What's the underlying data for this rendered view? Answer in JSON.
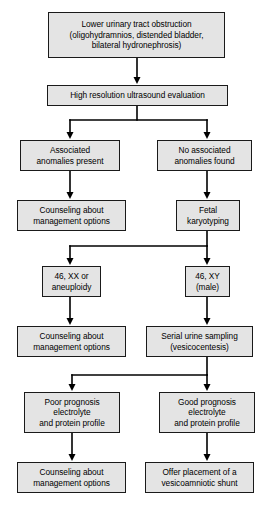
{
  "diagram": {
    "box_fill_color": "#e4e4e4",
    "box_border_color": "#1a1a1a",
    "connector_color": "#000000",
    "background_color": "#ffffff"
  },
  "nodes": [
    {
      "id": "lower-urinary-tract-obstruction",
      "text": "Lower urinary tract obstruction\n(oligohydramnios, distended bladder,\nbilateral hydronephrosis)",
      "x": 48,
      "y": 12,
      "w": 177,
      "h": 46
    },
    {
      "id": "high-resolution-ultrasound-evaluation",
      "text": "High resolution ultrasound evaluation",
      "x": 47,
      "y": 85,
      "w": 181,
      "h": 21
    },
    {
      "id": "associated-anomalies-present",
      "text": "Associated\nanomalies present",
      "x": 20,
      "y": 140,
      "w": 100,
      "h": 31
    },
    {
      "id": "no-associated-anomalies-found",
      "text": "No associated\nanomalies found",
      "x": 157,
      "y": 140,
      "w": 95,
      "h": 31
    },
    {
      "id": "counseling-about-management-options-1",
      "text": "Counseling about\nmanagement options",
      "x": 17,
      "y": 200,
      "w": 109,
      "h": 31
    },
    {
      "id": "fetal-karyotyping",
      "text": "Fetal\nkaryotyping",
      "x": 176,
      "y": 200,
      "w": 64,
      "h": 31
    },
    {
      "id": "46-xx-or-aneuploidy",
      "text": "46, XX or\naneuploidy",
      "x": 42,
      "y": 266,
      "w": 59,
      "h": 31
    },
    {
      "id": "46-xy-male",
      "text": "46, XY\n(male)",
      "x": 185,
      "y": 266,
      "w": 45,
      "h": 31
    },
    {
      "id": "counseling-about-management-options-2",
      "text": "Counseling about\nmanagement options",
      "x": 17,
      "y": 326,
      "w": 109,
      "h": 31
    },
    {
      "id": "serial-urine-sampling-vesicocentesis",
      "text": "Serial urine sampling\n(vesicocentesis)",
      "x": 146,
      "y": 326,
      "w": 107,
      "h": 31
    },
    {
      "id": "poor-prognosis-electrolyte-and-protein-profile",
      "text": "Poor prognosis\nelectrolyte\nand protein profile",
      "x": 24,
      "y": 392,
      "w": 96,
      "h": 41
    },
    {
      "id": "good-prognosis-electrolyte-and-protein-profile",
      "text": "Good prognosis\nelectrolyte\nand protein profile",
      "x": 159,
      "y": 392,
      "w": 96,
      "h": 41
    },
    {
      "id": "counseling-about-management-options-3",
      "text": "Counseling about\nmanagement options",
      "x": 17,
      "y": 462,
      "w": 109,
      "h": 31
    },
    {
      "id": "offer-placement-of-a-vesicoamniotic-shunt",
      "text": "Offer placement of a\nvesicoamniotic shunt",
      "x": 145,
      "y": 462,
      "w": 109,
      "h": 31
    }
  ],
  "connectors": {
    "stroke_width": 1.6,
    "arrow_width": 7,
    "arrow_height": 7,
    "segments": [
      {
        "name": "obstruction-to-ultrasound",
        "points": "137,58 137,80"
      },
      {
        "name": "ultrasound-split-stem",
        "points": "137,106 137,120"
      },
      {
        "name": "ultrasound-split-bar",
        "points": "70,120 207,120"
      },
      {
        "name": "split1-left-drop",
        "points": "70,120 70,134"
      },
      {
        "name": "split1-right-drop",
        "points": "207,120 207,134"
      },
      {
        "name": "anomalies-present-to-counseling",
        "points": "70,171 70,194"
      },
      {
        "name": "no-anomalies-to-karyotyping",
        "points": "207,171 207,194"
      },
      {
        "name": "karyotyping-split-stem",
        "points": "207,231 207,246"
      },
      {
        "name": "karyotyping-split-bar",
        "points": "70,246 207,246"
      },
      {
        "name": "split2-left-drop",
        "points": "70,246 70,260"
      },
      {
        "name": "split2-right-drop",
        "points": "207,246 207,260"
      },
      {
        "name": "xx-to-counseling",
        "points": "70,297 70,320"
      },
      {
        "name": "xy-to-serial-urine",
        "points": "207,297 207,320"
      },
      {
        "name": "serial-urine-split-stem",
        "points": "207,357 207,375"
      },
      {
        "name": "serial-urine-split-bar",
        "points": "72,375 207,375"
      },
      {
        "name": "split3-left-drop",
        "points": "72,375 72,386"
      },
      {
        "name": "split3-right-drop",
        "points": "207,375 207,386"
      },
      {
        "name": "poor-prognosis-to-counseling",
        "points": "72,433 72,456"
      },
      {
        "name": "good-prognosis-to-shunt",
        "points": "207,433 207,456"
      }
    ],
    "arrowheads": [
      {
        "name": "arrow-to-ultrasound",
        "x": 137,
        "y": 84
      },
      {
        "name": "arrow-to-anomalies-present",
        "x": 70,
        "y": 139
      },
      {
        "name": "arrow-to-no-anomalies",
        "x": 207,
        "y": 139
      },
      {
        "name": "arrow-to-counseling-1",
        "x": 70,
        "y": 199
      },
      {
        "name": "arrow-to-karyotyping",
        "x": 207,
        "y": 199
      },
      {
        "name": "arrow-to-xx-aneuploidy",
        "x": 70,
        "y": 265
      },
      {
        "name": "arrow-to-xy-male",
        "x": 207,
        "y": 265
      },
      {
        "name": "arrow-to-counseling-2",
        "x": 70,
        "y": 325
      },
      {
        "name": "arrow-to-serial-urine",
        "x": 207,
        "y": 325
      },
      {
        "name": "arrow-to-poor-prognosis",
        "x": 72,
        "y": 391
      },
      {
        "name": "arrow-to-good-prognosis",
        "x": 207,
        "y": 391
      },
      {
        "name": "arrow-to-counseling-3",
        "x": 72,
        "y": 461
      },
      {
        "name": "arrow-to-shunt",
        "x": 207,
        "y": 461
      }
    ]
  }
}
